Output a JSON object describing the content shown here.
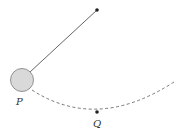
{
  "diagram": {
    "type": "pendulum",
    "colors": {
      "string": "#555555",
      "bob_fill": "#d9d9d9",
      "bob_stroke": "#888888",
      "path": "#777777",
      "point": "#222222"
    },
    "pivot": {
      "x": 97,
      "y": 10
    },
    "bob": {
      "cx": 22,
      "cy": 80,
      "r": 11.5
    },
    "lowest_point": {
      "x": 97,
      "y": 112
    },
    "labels": {
      "P": "P",
      "Q": "Q"
    }
  }
}
